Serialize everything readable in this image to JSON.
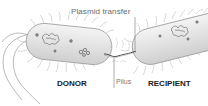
{
  "diagram": {
    "type": "bacterial-conjugation",
    "labels": {
      "plasmid_transfer": "Plasmid transfer",
      "pilus": "Pilus",
      "donor": "DONOR",
      "recipient": "RECIPIENT"
    },
    "colors": {
      "cell_fill": "#e6e6e6",
      "cell_outline": "#9a9a9a",
      "hair": "#b8b8b8",
      "dna": "#555555",
      "label_text": "#1a1a1a",
      "callout_text": "#6a6a6a"
    }
  }
}
